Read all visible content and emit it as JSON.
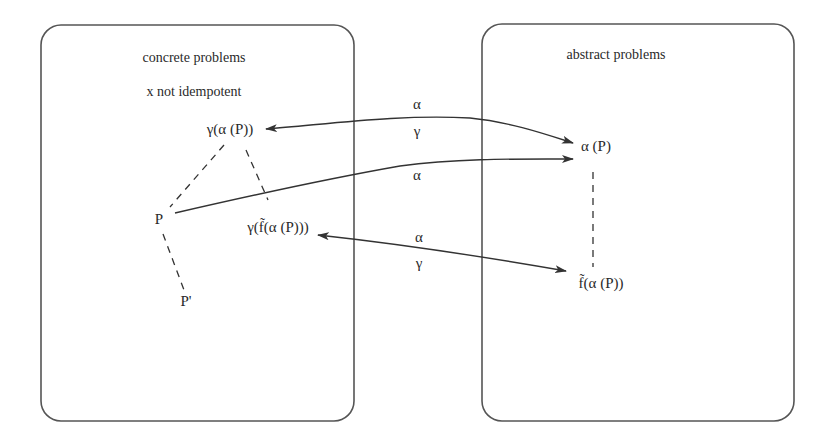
{
  "diagram": {
    "concrete_box": {
      "title": "concrete problems",
      "subtitle": "x not idempotent",
      "nodes": {
        "gamma_alpha_p": "γ(α (P))",
        "p": "P",
        "p_prime": "P'",
        "gamma_f_alpha_p": "γ(f̃(α (P)))"
      }
    },
    "abstract_box": {
      "title": "abstract problems",
      "nodes": {
        "alpha_p": "α (P)",
        "f_alpha_p": "f̃(α (P))"
      }
    },
    "edges": [
      {
        "id": "top-bidirectional",
        "from": "γ(α (P))",
        "to": "α (P)",
        "label_top": "α",
        "label_bottom": "γ",
        "style": "solid",
        "direction": "both"
      },
      {
        "id": "middle-forward",
        "from": "P",
        "to": "α (P)",
        "label_bottom": "α",
        "style": "solid",
        "direction": "forward"
      },
      {
        "id": "bottom-bidirectional",
        "from": "γ(f̃(α (P)))",
        "to": "f̃(α (P))",
        "label_top": "α",
        "label_bottom": "γ",
        "style": "solid",
        "direction": "both"
      },
      {
        "id": "dash-gamma-alpha-to-p",
        "from": "γ(α (P))",
        "to": "P",
        "style": "dashed"
      },
      {
        "id": "dash-gamma-alpha-to-gamma-f",
        "from": "γ(α (P))",
        "to": "γ(f̃(α (P)))",
        "style": "dashed"
      },
      {
        "id": "dash-p-to-pprime",
        "from": "P",
        "to": "P'",
        "style": "dashed"
      },
      {
        "id": "dash-alpha-p-to-f",
        "from": "α (P)",
        "to": "f̃(α (P))",
        "style": "dashed"
      }
    ],
    "labels": {
      "top_alpha": "α",
      "top_gamma": "γ",
      "middle_alpha": "α",
      "bottom_alpha": "α",
      "bottom_gamma": "γ"
    }
  }
}
